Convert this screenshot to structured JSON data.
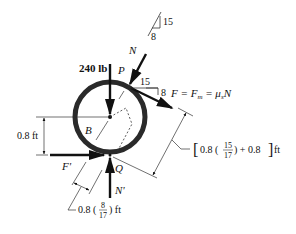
{
  "diagram": {
    "type": "free-body-diagram",
    "colors": {
      "ink": "#111111",
      "ring": "#2a2a2a",
      "background": "#ffffff"
    },
    "labels": {
      "weight": "240 lb",
      "point_p": "P",
      "point_q": "Q",
      "center_b": "B",
      "normal_n": "N",
      "normal_n_prime": "N'",
      "friction_f_prime": "F'",
      "friction_eq": "F = F",
      "friction_eq_sub": "m",
      "friction_eq_rest": " = μ",
      "friction_eq_sub2": "s",
      "friction_eq_end": "N",
      "slope_top_rise": "15",
      "slope_top_run": "8",
      "slope_p_run": "15",
      "slope_p_rise": "8",
      "dim_vertical": "0.8 ft",
      "dim_bottom_prefix": "0.8 (",
      "dim_bottom_num": "8",
      "dim_bottom_den": "17",
      "dim_bottom_suffix": ") ft",
      "dim_right_prefix": "0.8 (",
      "dim_right_num": "15",
      "dim_right_den": "17",
      "dim_right_suffix": ") + 0.8",
      "dim_right_unit": "ft"
    }
  }
}
